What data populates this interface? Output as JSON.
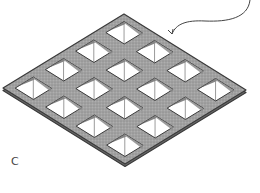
{
  "figure": {
    "label": "C",
    "grid": {
      "rows": 4,
      "cols": 4,
      "vertices": {
        "top": [
          124,
          14
        ],
        "right": [
          246,
          90
        ],
        "bottom": [
          124,
          164
        ],
        "left": [
          3,
          88
        ]
      },
      "bar_color": "#9a9a9a",
      "bar_outline_color": "#3a3a3a",
      "cell_fill": "#ffffff",
      "inner_line_color": "#555555"
    },
    "leader_arrow": {
      "color": "#444444",
      "path": "M 250 0 C 248 18, 228 22, 205 21 C 186 20, 176 24, 172 34",
      "arrow_tip": [
        172,
        34
      ]
    }
  }
}
